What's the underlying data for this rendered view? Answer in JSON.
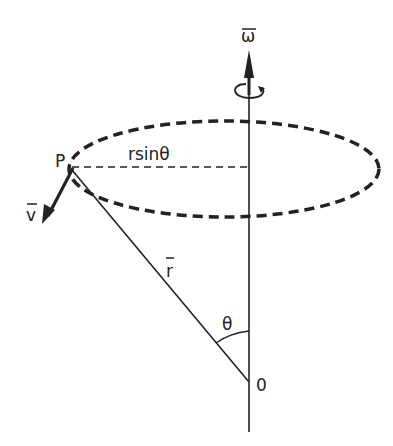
{
  "labels": {
    "omega": "ω",
    "point": "P",
    "velocity": "v",
    "radius_expr": "rsinθ",
    "position": "r",
    "angle": "θ",
    "origin": "0"
  },
  "colors": {
    "ink": "#222222",
    "background": "#ffffff"
  }
}
